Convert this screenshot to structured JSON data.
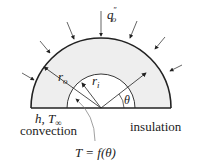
{
  "diagram": {
    "type": "half-cylinder heat conduction schematic",
    "labels": {
      "heat_flux": "q",
      "heat_flux_sup": "″",
      "heat_flux_sub": "o",
      "outer_radius": "r",
      "outer_radius_sub": "o",
      "inner_radius": "r",
      "inner_radius_sub": "i",
      "angle": "θ",
      "convection_params": "h, T",
      "convection_params_sub": "∞",
      "convection": "convection",
      "insulation": "insulation",
      "temperature": "T = f(θ)"
    },
    "colors": {
      "fill": "#eeeeee",
      "stroke": "#222222"
    }
  }
}
